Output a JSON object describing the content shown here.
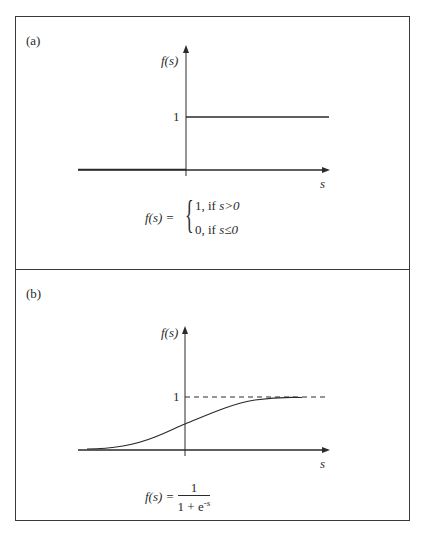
{
  "panels": [
    {
      "id": "a",
      "label": "(a)",
      "y_axis_label": "f(s)",
      "x_axis_label": "s",
      "y_tick_label": "1",
      "curve_type": "step",
      "formula": {
        "lhs": "f(s) =",
        "cases": [
          {
            "value": "1, if",
            "condition": "s>0"
          },
          {
            "value": "0, if",
            "condition": "s≤0"
          }
        ]
      }
    },
    {
      "id": "b",
      "label": "(b)",
      "y_axis_label": "f(s)",
      "x_axis_label": "s",
      "y_tick_label": "1",
      "curve_type": "sigmoid",
      "asymptote": "dashed line at f(s)=1",
      "formula": {
        "lhs": "f(s) =",
        "numerator": "1",
        "denominator_base": "1 + e",
        "denominator_exp": "-s"
      }
    }
  ],
  "colors": {
    "line": "#2a2a2a",
    "frame": "#3a3a3a",
    "background": "#ffffff"
  }
}
